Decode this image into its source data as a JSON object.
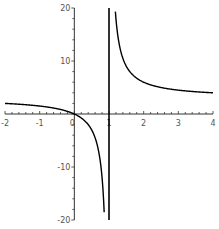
{
  "chart_data": {
    "type": "line",
    "title": "",
    "xlabel": "",
    "ylabel": "",
    "xlim": [
      -2,
      4
    ],
    "ylim": [
      -20,
      20
    ],
    "grid": false,
    "legend": null,
    "function": "y = 3x/(x-1)",
    "vertical_asymptote_line": 1,
    "x_ticks": [
      -2,
      -1,
      1,
      2,
      3,
      4
    ],
    "x_tick_labels": [
      "-2",
      "-1",
      "1",
      "2",
      "3",
      "4"
    ],
    "y_ticks": [
      -20,
      -10,
      10,
      20
    ],
    "y_tick_labels": [
      "-20",
      "-10",
      "10",
      "20"
    ],
    "origin_label": "0",
    "series": [
      {
        "name": "curve",
        "color": "#000000",
        "points": [
          [
            -2,
            2.0
          ],
          [
            -1.5,
            1.8
          ],
          [
            -1,
            1.5
          ],
          [
            -0.5,
            1.0
          ],
          [
            0,
            0
          ],
          [
            0.25,
            -1.0
          ],
          [
            0.5,
            -3.0
          ],
          [
            0.7,
            -7.0
          ],
          [
            0.8,
            -12.0
          ],
          [
            0.87,
            -20.0
          ],
          [
            1.13,
            26.1
          ],
          [
            1.2,
            18.0
          ],
          [
            1.3,
            13.0
          ],
          [
            1.5,
            9.0
          ],
          [
            2,
            6.0
          ],
          [
            2.5,
            5.0
          ],
          [
            3,
            4.5
          ],
          [
            3.5,
            4.2
          ],
          [
            4,
            4.0
          ]
        ]
      }
    ]
  }
}
